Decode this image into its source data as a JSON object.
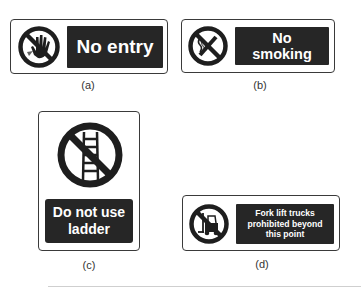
{
  "signs": [
    {
      "id": "a",
      "label": "No entry",
      "caption": "(a)",
      "symbol": "no-entry-hand-icon"
    },
    {
      "id": "b",
      "label": "No\nsmoking",
      "caption": "(b)",
      "symbol": "no-smoking-icon"
    },
    {
      "id": "c",
      "label": "Do not use\nladder",
      "caption": "(c)",
      "symbol": "no-ladder-icon"
    },
    {
      "id": "d",
      "label": "Fork lift trucks\nprohibited beyond\nthis point",
      "caption": "(d)",
      "symbol": "no-forklift-icon"
    }
  ],
  "colors": {
    "panel": "#262626",
    "panel_text": "#ffffff",
    "border": "#3a3a3a",
    "caption": "#333333"
  }
}
